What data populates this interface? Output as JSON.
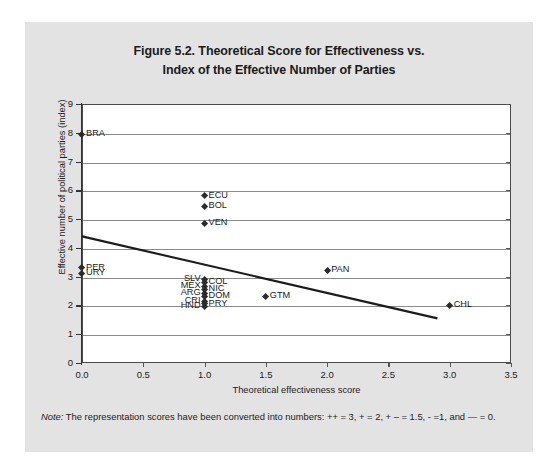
{
  "figure": {
    "title_line1": "Figure 5.2. Theoretical Score for Effectiveness vs.",
    "title_line2": "Index of the Effective Number of Parties",
    "note_word": "Note:",
    "note_text": " The representation scores have been converted into numbers: ++ = 3, + = 2, + – = 1.5, - =1, and — = 0."
  },
  "chart_data": {
    "type": "scatter",
    "title": "Figure 5.2. Theoretical Score for Effectiveness vs. Index of the Effective Number of Parties",
    "xlabel": "Theoretical effectiveness score",
    "ylabel": "Effective number of political parties (index)",
    "xlim": [
      0,
      3.5
    ],
    "ylim": [
      0,
      9
    ],
    "grid": "horizontal",
    "legend": "none",
    "x_ticks": [
      "0.0",
      "0.5",
      "1.0",
      "1.5",
      "2.0",
      "2.5",
      "3.0",
      "3.5"
    ],
    "x_tick_values": [
      0,
      0.5,
      1,
      1.5,
      2,
      2.5,
      3,
      3.5
    ],
    "y_ticks": [
      "0",
      "1",
      "2",
      "3",
      "4",
      "5",
      "6",
      "7",
      "8",
      "9"
    ],
    "y_tick_values": [
      0,
      1,
      2,
      3,
      4,
      5,
      6,
      7,
      8,
      9
    ],
    "points": [
      {
        "label": "BRA",
        "x": 0,
        "y": 7.95,
        "label_side": "right"
      },
      {
        "label": "ECU",
        "x": 1.0,
        "y": 5.8,
        "label_side": "right"
      },
      {
        "label": "BOL",
        "x": 1.0,
        "y": 5.45,
        "label_side": "right"
      },
      {
        "label": "VEN",
        "x": 1.0,
        "y": 4.85,
        "label_side": "right"
      },
      {
        "label": "PER",
        "x": 0,
        "y": 3.3,
        "label_side": "right"
      },
      {
        "label": "URY",
        "x": 0,
        "y": 3.1,
        "label_side": "right"
      },
      {
        "label": "PAN",
        "x": 2.0,
        "y": 3.2,
        "label_side": "right"
      },
      {
        "label": "SLV",
        "x": 1.0,
        "y": 2.9,
        "label_side": "left"
      },
      {
        "label": "COL",
        "x": 1.0,
        "y": 2.8,
        "label_side": "right"
      },
      {
        "label": "MEX",
        "x": 1.0,
        "y": 2.65,
        "label_side": "left"
      },
      {
        "label": "NIC",
        "x": 1.0,
        "y": 2.55,
        "label_side": "right"
      },
      {
        "label": "ARG",
        "x": 1.0,
        "y": 2.4,
        "label_side": "left"
      },
      {
        "label": "DOM",
        "x": 1.0,
        "y": 2.3,
        "label_side": "right"
      },
      {
        "label": "CRI",
        "x": 1.0,
        "y": 2.15,
        "label_side": "left"
      },
      {
        "label": "PRY",
        "x": 1.0,
        "y": 2.05,
        "label_side": "right"
      },
      {
        "label": "HND",
        "x": 1.0,
        "y": 1.95,
        "label_side": "left"
      },
      {
        "label": "GTM",
        "x": 1.5,
        "y": 2.3,
        "label_side": "right"
      },
      {
        "label": "CHL",
        "x": 3.0,
        "y": 2.0,
        "label_side": "right"
      }
    ],
    "trendline": {
      "type": "linear",
      "x_start": 0,
      "y_start": 4.4,
      "x_end": 2.9,
      "y_end": 1.55
    },
    "colors": {
      "marker": "#2b2b2b",
      "trendline": "#1b1b1b",
      "gridline": "#8a8a8a",
      "plot_background": "#ffffff",
      "panel_background": "#e3e3e3"
    }
  }
}
